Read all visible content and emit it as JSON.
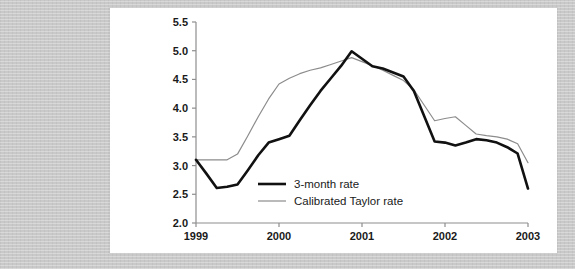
{
  "chart_data": {
    "type": "line",
    "title": "",
    "subtitle": "",
    "xlabel": "",
    "ylabel": "",
    "xlim": [
      1999.0,
      2003.0
    ],
    "ylim": [
      2.0,
      5.5
    ],
    "grid": false,
    "legend_position": "center-left-inside",
    "x_tick_labels": [
      "1999",
      "2000",
      "2001",
      "2002",
      "2003"
    ],
    "x_ticks": [
      1999,
      2000,
      2001,
      2002,
      2003
    ],
    "y_tick_labels": [
      "2.0",
      "2.5",
      "3.0",
      "3.5",
      "4.0",
      "4.5",
      "5.0",
      "5.5"
    ],
    "y_ticks": [
      2.0,
      2.5,
      3.0,
      3.5,
      4.0,
      4.5,
      5.0,
      5.5
    ],
    "x": [
      1999.0,
      1999.125,
      1999.25,
      1999.375,
      1999.5,
      1999.625,
      1999.75,
      1999.875,
      2000.0,
      2000.125,
      2000.25,
      2000.375,
      2000.5,
      2000.625,
      2000.75,
      2000.875,
      2001.0,
      2001.125,
      2001.25,
      2001.375,
      2001.5,
      2001.625,
      2001.75,
      2001.875,
      2002.0,
      2002.125,
      2002.25,
      2002.375,
      2002.5,
      2002.625,
      2002.75,
      2002.875,
      2003.0
    ],
    "series": [
      {
        "name": "3-month rate",
        "color": "#111111",
        "linewidth": 2.6,
        "values": [
          3.1,
          2.86,
          2.61,
          2.63,
          2.67,
          2.92,
          3.18,
          3.4,
          3.46,
          3.52,
          3.79,
          4.05,
          4.3,
          4.52,
          4.74,
          4.99,
          4.86,
          4.73,
          4.69,
          4.62,
          4.55,
          4.3,
          3.86,
          3.42,
          3.4,
          3.35,
          3.4,
          3.46,
          3.44,
          3.4,
          3.32,
          3.21,
          2.6
        ]
      },
      {
        "name": "Calibrated Taylor rate",
        "color": "#8c8c8c",
        "linewidth": 1.2,
        "values": [
          3.1,
          3.1,
          3.1,
          3.1,
          3.2,
          3.52,
          3.85,
          4.16,
          4.42,
          4.52,
          4.6,
          4.66,
          4.7,
          4.76,
          4.82,
          4.88,
          4.81,
          4.74,
          4.66,
          4.57,
          4.48,
          4.32,
          4.05,
          3.78,
          3.82,
          3.85,
          3.7,
          3.55,
          3.52,
          3.5,
          3.46,
          3.38,
          3.05
        ]
      }
    ],
    "legend_entries": [
      {
        "label": "3-month rate",
        "color": "#111111",
        "linewidth": 2.6
      },
      {
        "label": "Calibrated Taylor rate",
        "color": "#8c8c8c",
        "linewidth": 1.2
      }
    ],
    "colors": {
      "panel_background": "#ffffff",
      "page_background": "#c9c9c9",
      "axis": "#8e8e8e",
      "text": "#1a1a1a",
      "series_3month": "#111111",
      "series_taylor": "#8c8c8c"
    }
  }
}
